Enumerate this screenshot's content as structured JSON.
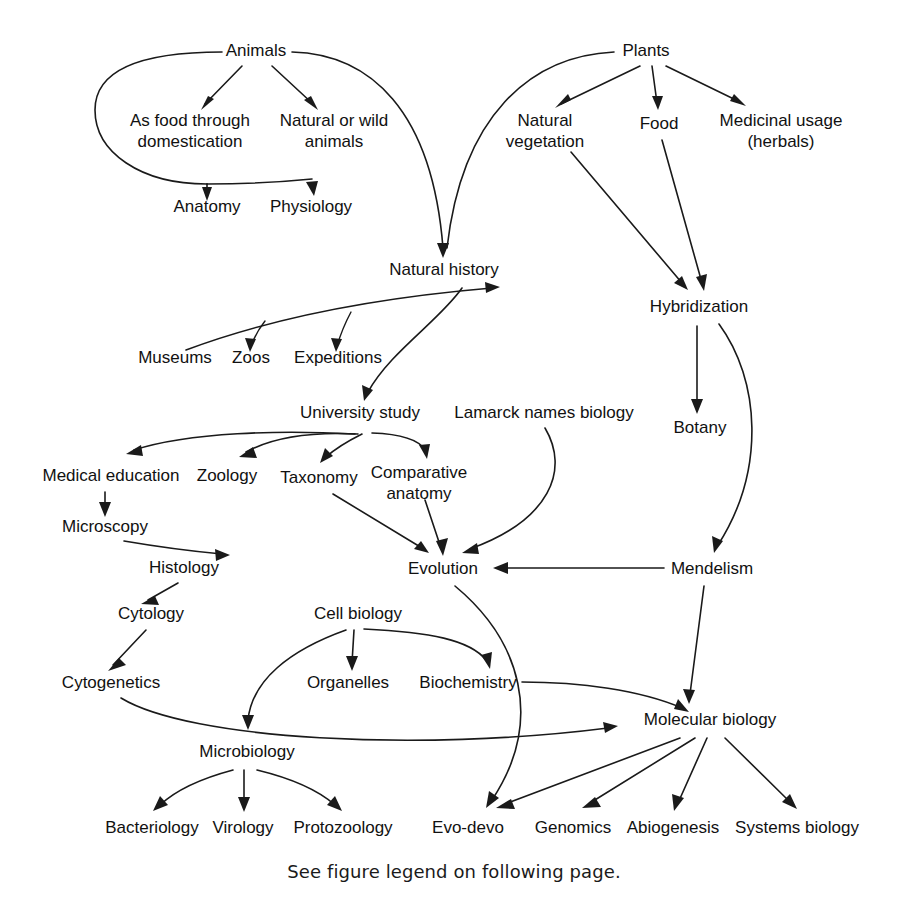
{
  "figure": {
    "caption": "See figure legend on following page.",
    "colors": {
      "background": "#ffffff",
      "ink": "#1a1a1a",
      "text": "#111111"
    }
  },
  "nodes": [
    {
      "id": "animals",
      "label": "Animals",
      "x": 256,
      "y": 56,
      "lines": [
        "Animals"
      ]
    },
    {
      "id": "plants",
      "label": "Plants",
      "x": 646,
      "y": 56,
      "lines": [
        "Plants"
      ]
    },
    {
      "id": "as-food",
      "label": "As food through domestication",
      "x": 190,
      "y": 126,
      "lines": [
        "As food through",
        "domestication"
      ]
    },
    {
      "id": "natural-wild",
      "label": "Natural or wild animals",
      "x": 334,
      "y": 126,
      "lines": [
        "Natural or wild",
        "animals"
      ]
    },
    {
      "id": "natural-vegetation",
      "label": "Natural vegetation",
      "x": 545,
      "y": 126,
      "lines": [
        "Natural",
        "vegetation"
      ]
    },
    {
      "id": "food",
      "label": "Food",
      "x": 659,
      "y": 129,
      "lines": [
        "Food"
      ]
    },
    {
      "id": "medicinal-usage",
      "label": "Medicinal usage (herbals)",
      "x": 781,
      "y": 126,
      "lines": [
        "Medicinal usage",
        "(herbals)"
      ]
    },
    {
      "id": "anatomy",
      "label": "Anatomy",
      "x": 207,
      "y": 212,
      "lines": [
        "Anatomy"
      ]
    },
    {
      "id": "physiology",
      "label": "Physiology",
      "x": 311,
      "y": 212,
      "lines": [
        "Physiology"
      ]
    },
    {
      "id": "natural-history",
      "label": "Natural history",
      "x": 444,
      "y": 275,
      "lines": [
        "Natural history"
      ]
    },
    {
      "id": "hybridization",
      "label": "Hybridization",
      "x": 699,
      "y": 312,
      "lines": [
        "Hybridization"
      ]
    },
    {
      "id": "museums",
      "label": "Museums",
      "x": 175,
      "y": 363,
      "lines": [
        "Museums"
      ]
    },
    {
      "id": "zoos",
      "label": "Zoos",
      "x": 251,
      "y": 363,
      "lines": [
        "Zoos"
      ]
    },
    {
      "id": "expeditions",
      "label": "Expeditions",
      "x": 338,
      "y": 363,
      "lines": [
        "Expeditions"
      ]
    },
    {
      "id": "botany",
      "label": "Botany",
      "x": 700,
      "y": 433,
      "lines": [
        "Botany"
      ]
    },
    {
      "id": "university-study",
      "label": "University study",
      "x": 360,
      "y": 418,
      "lines": [
        "University study"
      ]
    },
    {
      "id": "lamarck",
      "label": "Lamarck names biology",
      "x": 544,
      "y": 418,
      "lines": [
        "Lamarck names biology"
      ]
    },
    {
      "id": "medical-education",
      "label": "Medical education",
      "x": 111,
      "y": 481,
      "lines": [
        "Medical education"
      ]
    },
    {
      "id": "zoology",
      "label": "Zoology",
      "x": 227,
      "y": 481,
      "lines": [
        "Zoology"
      ]
    },
    {
      "id": "taxonomy",
      "label": "Taxonomy",
      "x": 319,
      "y": 483,
      "lines": [
        "Taxonomy"
      ]
    },
    {
      "id": "comparative-anatomy",
      "label": "Comparative anatomy",
      "x": 419,
      "y": 478,
      "lines": [
        "Comparative",
        "anatomy"
      ]
    },
    {
      "id": "microscopy",
      "label": "Microscopy",
      "x": 105,
      "y": 532,
      "lines": [
        "Microscopy"
      ]
    },
    {
      "id": "histology",
      "label": "Histology",
      "x": 184,
      "y": 573,
      "lines": [
        "Histology"
      ]
    },
    {
      "id": "evolution",
      "label": "Evolution",
      "x": 443,
      "y": 574,
      "lines": [
        "Evolution"
      ]
    },
    {
      "id": "mendelism",
      "label": "Mendelism",
      "x": 712,
      "y": 574,
      "lines": [
        "Mendelism"
      ]
    },
    {
      "id": "cytology",
      "label": "Cytology",
      "x": 151,
      "y": 619,
      "lines": [
        "Cytology"
      ]
    },
    {
      "id": "cell-biology",
      "label": "Cell biology",
      "x": 358,
      "y": 619,
      "lines": [
        "Cell biology"
      ]
    },
    {
      "id": "cytogenetics",
      "label": "Cytogenetics",
      "x": 111,
      "y": 688,
      "lines": [
        "Cytogenetics"
      ]
    },
    {
      "id": "organelles",
      "label": "Organelles",
      "x": 348,
      "y": 688,
      "lines": [
        "Organelles"
      ]
    },
    {
      "id": "biochemistry",
      "label": "Biochemistry",
      "x": 468,
      "y": 688,
      "lines": [
        "Biochemistry"
      ]
    },
    {
      "id": "molecular-biology",
      "label": "Molecular biology",
      "x": 710,
      "y": 725,
      "lines": [
        "Molecular biology"
      ]
    },
    {
      "id": "microbiology",
      "label": "Microbiology",
      "x": 247,
      "y": 757,
      "lines": [
        "Microbiology"
      ]
    },
    {
      "id": "bacteriology",
      "label": "Bacteriology",
      "x": 152,
      "y": 833,
      "lines": [
        "Bacteriology"
      ]
    },
    {
      "id": "virology",
      "label": "Virology",
      "x": 243,
      "y": 833,
      "lines": [
        "Virology"
      ]
    },
    {
      "id": "protozoology",
      "label": "Protozoology",
      "x": 343,
      "y": 833,
      "lines": [
        "Protozoology"
      ]
    },
    {
      "id": "evo-devo",
      "label": "Evo-devo",
      "x": 468,
      "y": 833,
      "lines": [
        "Evo-devo"
      ]
    },
    {
      "id": "genomics",
      "label": "Genomics",
      "x": 573,
      "y": 833,
      "lines": [
        "Genomics"
      ]
    },
    {
      "id": "abiogenesis",
      "label": "Abiogenesis",
      "x": 673,
      "y": 833,
      "lines": [
        "Abiogenesis"
      ]
    },
    {
      "id": "systems-biology",
      "label": "Systems biology",
      "x": 797,
      "y": 833,
      "lines": [
        "Systems biology"
      ]
    }
  ],
  "edges": [
    {
      "from": "animals",
      "to": "as-food",
      "style": "straight"
    },
    {
      "from": "animals",
      "to": "natural-wild",
      "style": "straight"
    },
    {
      "from": "animals",
      "to": "anatomy",
      "style": "curve-left-loop"
    },
    {
      "from": "animals",
      "to": "physiology",
      "style": "curve-left-loop"
    },
    {
      "from": "animals",
      "to": "natural-history",
      "style": "long-curve"
    },
    {
      "from": "plants",
      "to": "natural-vegetation",
      "style": "straight"
    },
    {
      "from": "plants",
      "to": "food",
      "style": "straight"
    },
    {
      "from": "plants",
      "to": "medicinal-usage",
      "style": "straight"
    },
    {
      "from": "plants",
      "to": "natural-history",
      "style": "long-curve"
    },
    {
      "from": "natural-vegetation",
      "to": "hybridization",
      "style": "straight"
    },
    {
      "from": "food",
      "to": "hybridization",
      "style": "straight"
    },
    {
      "from": "museums",
      "to": "natural-history",
      "style": "curve"
    },
    {
      "from": "natural-history",
      "to": "zoos",
      "style": "curve"
    },
    {
      "from": "natural-history",
      "to": "expeditions",
      "style": "curve"
    },
    {
      "from": "natural-history",
      "to": "university-study",
      "style": "curve"
    },
    {
      "from": "hybridization",
      "to": "botany",
      "style": "straight"
    },
    {
      "from": "hybridization",
      "to": "mendelism",
      "style": "curve"
    },
    {
      "from": "university-study",
      "to": "medical-education",
      "style": "curve"
    },
    {
      "from": "university-study",
      "to": "zoology",
      "style": "curve"
    },
    {
      "from": "university-study",
      "to": "taxonomy",
      "style": "curve"
    },
    {
      "from": "university-study",
      "to": "comparative-anatomy",
      "style": "curve"
    },
    {
      "from": "medical-education",
      "to": "microscopy",
      "style": "straight"
    },
    {
      "from": "microscopy",
      "to": "histology",
      "style": "curve"
    },
    {
      "from": "histology",
      "to": "cytology",
      "style": "straight"
    },
    {
      "from": "cytology",
      "to": "cytogenetics",
      "style": "straight"
    },
    {
      "from": "taxonomy",
      "to": "evolution",
      "style": "straight"
    },
    {
      "from": "comparative-anatomy",
      "to": "evolution",
      "style": "straight"
    },
    {
      "from": "lamarck",
      "to": "evolution",
      "style": "curve"
    },
    {
      "from": "mendelism",
      "to": "evolution",
      "style": "straight"
    },
    {
      "from": "mendelism",
      "to": "molecular-biology",
      "style": "straight"
    },
    {
      "from": "cell-biology",
      "to": "organelles",
      "style": "straight"
    },
    {
      "from": "cell-biology",
      "to": "biochemistry",
      "style": "curve"
    },
    {
      "from": "cell-biology",
      "to": "microbiology",
      "style": "curve"
    },
    {
      "from": "biochemistry",
      "to": "molecular-biology",
      "style": "curve"
    },
    {
      "from": "cytogenetics",
      "to": "molecular-biology",
      "style": "long-curve"
    },
    {
      "from": "evolution",
      "to": "evo-devo",
      "style": "long-curve"
    },
    {
      "from": "molecular-biology",
      "to": "evo-devo",
      "style": "straight"
    },
    {
      "from": "molecular-biology",
      "to": "genomics",
      "style": "straight"
    },
    {
      "from": "molecular-biology",
      "to": "abiogenesis",
      "style": "straight"
    },
    {
      "from": "molecular-biology",
      "to": "systems-biology",
      "style": "straight"
    }
  ]
}
